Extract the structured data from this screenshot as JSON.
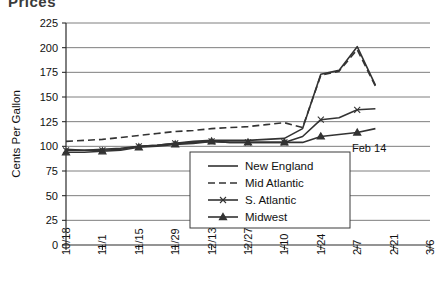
{
  "title_partial": "Prices",
  "annotation": {
    "label": "Feb 14",
    "x_value": "2/7"
  },
  "axis": {
    "y_label": "Cents Per Gallon",
    "y_ticks": [
      "0",
      "25",
      "50",
      "75",
      "100",
      "125",
      "150",
      "175",
      "200",
      "225"
    ],
    "x_ticks": [
      "10/18",
      "11/1",
      "11/15",
      "11/29",
      "12/13",
      "12/27",
      "1/10",
      "1/24",
      "2/7",
      "2/21",
      "3/6"
    ]
  },
  "legend": {
    "items": [
      {
        "label": "New England",
        "style": "solid"
      },
      {
        "label": "Mid Atlantic",
        "style": "dashed"
      },
      {
        "label": "S. Atlantic",
        "style": "solid-x"
      },
      {
        "label": "Midwest",
        "style": "solid-triangle"
      }
    ]
  },
  "chart_data": {
    "type": "line",
    "title": "Prices",
    "xlabel": "",
    "ylabel": "Cents Per Gallon",
    "ylim": [
      0,
      225
    ],
    "ytick_step": 25,
    "grid": true,
    "legend_position": "inside-center",
    "annotations": [
      {
        "text": "Feb 14",
        "near_x": "2/7",
        "near_y": 95
      }
    ],
    "x": [
      "10/18",
      "10/25",
      "11/1",
      "11/8",
      "11/15",
      "11/22",
      "11/29",
      "12/6",
      "12/13",
      "12/20",
      "12/27",
      "1/3",
      "1/10",
      "1/17",
      "1/24",
      "1/31",
      "2/7",
      "2/14"
    ],
    "series": [
      {
        "name": "New England",
        "style": "solid",
        "values": [
          97,
          96,
          97,
          98,
          100,
          101,
          103,
          105,
          106,
          106,
          106,
          107,
          108,
          118,
          173,
          177,
          201,
          162
        ]
      },
      {
        "name": "Mid Atlantic",
        "style": "dashed",
        "values": [
          105,
          106,
          107,
          109,
          111,
          113,
          115,
          116,
          118,
          119,
          120,
          122,
          124,
          119,
          172,
          176,
          198,
          161
        ]
      },
      {
        "name": "S. Atlantic",
        "style": "solid-x",
        "values": [
          96,
          96,
          96,
          97,
          100,
          101,
          103,
          104,
          105,
          104,
          104,
          104,
          104,
          110,
          127,
          129,
          137,
          138
        ]
      },
      {
        "name": "Midwest",
        "style": "solid-triangle",
        "values": [
          94,
          94,
          95,
          96,
          99,
          100,
          102,
          103,
          105,
          104,
          104,
          104,
          104,
          104,
          110,
          112,
          114,
          118
        ]
      }
    ]
  }
}
